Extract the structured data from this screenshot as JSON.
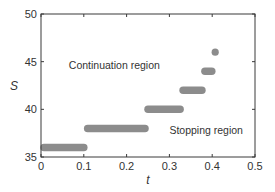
{
  "chart_data": {
    "type": "scatter",
    "title": "",
    "xlabel": "t",
    "ylabel": "S",
    "xlim": [
      0,
      0.5
    ],
    "ylim": [
      35,
      50
    ],
    "xticks": [
      0,
      0.1,
      0.2,
      0.3,
      0.4,
      0.5
    ],
    "xtick_labels": [
      "0",
      "0.1",
      "0.2",
      "0.3",
      "0.4",
      "0.5"
    ],
    "yticks": [
      35,
      40,
      45,
      50
    ],
    "ytick_labels": [
      "35",
      "40",
      "45",
      "50"
    ],
    "grid": false,
    "legend": null,
    "marker_color": "#8c8c8c",
    "series": [
      {
        "name": "boundary",
        "segments": [
          {
            "S": 36,
            "t_start": 0.0,
            "t_end": 0.107
          },
          {
            "S": 38,
            "t_start": 0.102,
            "t_end": 0.25
          },
          {
            "S": 40,
            "t_start": 0.243,
            "t_end": 0.332
          },
          {
            "S": 42,
            "t_start": 0.325,
            "t_end": 0.383
          },
          {
            "S": 44,
            "t_start": 0.376,
            "t_end": 0.406
          },
          {
            "S": 46,
            "t_start": 0.407,
            "t_end": 0.407
          }
        ]
      }
    ],
    "annotations": [
      {
        "text": "Continuation region",
        "t": 0.065,
        "S": 44.2
      },
      {
        "text": "Stopping region",
        "t": 0.3,
        "S": 37.4
      }
    ]
  }
}
